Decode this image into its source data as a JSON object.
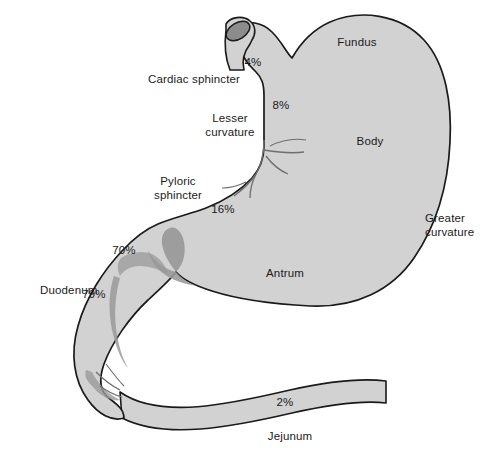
{
  "diagram": {
    "type": "anatomical-illustration",
    "colors": {
      "organ_fill": "#d2d2d2",
      "sphincter_shade": "#9a9a9a",
      "esophagus_lumen": "#8c8c8c",
      "outline": "#1a1a1a",
      "rugae_line": "#6e6e6e",
      "text": "#1a1a1a",
      "background": "#ffffff"
    },
    "region_labels": [
      {
        "id": "fundus",
        "text": "Fundus",
        "x": 357,
        "y": 46
      },
      {
        "id": "body",
        "text": "Body",
        "x": 370,
        "y": 145
      },
      {
        "id": "antrum",
        "text": "Antrum",
        "x": 285,
        "y": 277
      },
      {
        "id": "duodenum",
        "text": "Duodenum",
        "x": 40,
        "y": 294
      },
      {
        "id": "jejunum",
        "text": "Jejunum",
        "x": 290,
        "y": 440
      },
      {
        "id": "cardiac-sphincter",
        "text": "Cardiac sphincter",
        "x": 148,
        "y": 83
      }
    ],
    "stacked_labels": [
      {
        "id": "lesser-curvature",
        "line1": "Lesser",
        "line2": "curvature",
        "x": 230,
        "y": 122,
        "anchor": "middle"
      },
      {
        "id": "pyloric-sphincter",
        "line1": "Pyloric",
        "line2": "sphincter",
        "x": 178,
        "y": 185,
        "anchor": "middle"
      },
      {
        "id": "greater-curvature",
        "line1": "Greater",
        "line2": "curvature",
        "x": 425,
        "y": 222,
        "anchor": "start"
      }
    ],
    "percentages": [
      {
        "id": "pct-cardia",
        "region": "Cardiac sphincter / cardia",
        "value": 4,
        "text": "4%",
        "x": 253,
        "y": 66
      },
      {
        "id": "pct-fundus-body-upper",
        "region": "Upper body / lesser curvature",
        "value": 8,
        "text": "8%",
        "x": 281,
        "y": 109
      },
      {
        "id": "pct-antrum",
        "region": "Antrum / lesser curvature",
        "value": 16,
        "text": "16%",
        "x": 223,
        "y": 213
      },
      {
        "id": "pct-pylorus",
        "region": "Pyloric sphincter",
        "value": 70,
        "text": "70%",
        "x": 124,
        "y": 254
      },
      {
        "id": "pct-duodenum",
        "region": "Duodenum",
        "value": 79,
        "text": "79%",
        "x": 94,
        "y": 298
      },
      {
        "id": "pct-jejunum",
        "region": "Jejunum",
        "value": 2,
        "text": "2%",
        "x": 285,
        "y": 406
      }
    ]
  }
}
